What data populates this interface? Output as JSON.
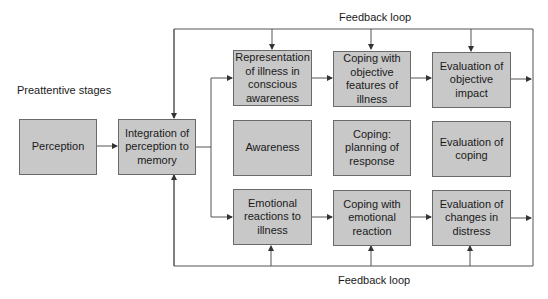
{
  "labels": {
    "feedback_top": "Feedback loop",
    "feedback_bottom": "Feedback loop",
    "preattentive": "Preattentive stages"
  },
  "boxes": {
    "perception": "Perception",
    "integration": "Integration of perception to memory",
    "representation": "Representation of illness in conscious awareness",
    "coping_objective": "Coping with objective features of illness",
    "evaluation_objective": "Evaluation of objective impact",
    "awareness": "Awareness",
    "coping_planning": "Coping: planning of response",
    "evaluation_coping": "Evaluation of coping",
    "emotional_reactions": "Emotional reactions to illness",
    "coping_emotional": "Coping with emotional reaction",
    "evaluation_distress": "Evaluation of changes in distress"
  },
  "colors": {
    "box_fill": "#c8c8c8",
    "box_border": "#6a6a6a",
    "line": "#555555"
  }
}
